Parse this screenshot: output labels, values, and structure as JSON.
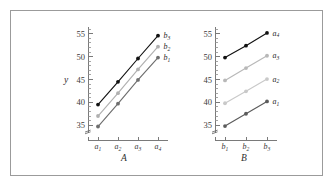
{
  "figure": {
    "background_color": "#ffffff",
    "frame_color": "#9b9b9b"
  },
  "chart_data": [
    {
      "type": "line",
      "panel_id": "A",
      "title": "",
      "xlabel": "A",
      "ylabel": "y",
      "categories": [
        "a1",
        "a2",
        "a3",
        "a4"
      ],
      "category_labels": [
        "a",
        "a",
        "a",
        "a"
      ],
      "category_subscripts": [
        "1",
        "2",
        "3",
        "4"
      ],
      "ylim": [
        33.5,
        56.5
      ],
      "yticks": [
        35,
        40,
        45,
        50,
        55
      ],
      "ytick_labels": [
        "35",
        "40",
        "45",
        "50",
        "55"
      ],
      "yminor_ticks": [
        36,
        37,
        38,
        39,
        41,
        42,
        43,
        44,
        46,
        47,
        48,
        49,
        51,
        52,
        53,
        54,
        56
      ],
      "axis_break": true,
      "grid": false,
      "legend": "inline-right",
      "series": [
        {
          "name": "b3",
          "label_base": "b",
          "label_sub": "3",
          "color": "#121212",
          "marker": "circle",
          "values": [
            39.5,
            44.5,
            49.6,
            54.6
          ]
        },
        {
          "name": "b2",
          "label_base": "b",
          "label_sub": "2",
          "color": "#b0b0b0",
          "marker": "circle",
          "values": [
            37.0,
            42.0,
            47.2,
            52.2
          ]
        },
        {
          "name": "b1",
          "label_base": "b",
          "label_sub": "1",
          "color": "#6e6e6e",
          "marker": "circle",
          "values": [
            34.7,
            39.7,
            44.9,
            49.8
          ]
        }
      ]
    },
    {
      "type": "line",
      "panel_id": "B",
      "title": "",
      "xlabel": "B",
      "ylabel": "",
      "categories": [
        "b1",
        "b2",
        "b3"
      ],
      "category_labels": [
        "b",
        "b",
        "b"
      ],
      "category_subscripts": [
        "1",
        "2",
        "3"
      ],
      "ylim": [
        33.5,
        56.5
      ],
      "yticks": [
        35,
        40,
        45,
        50,
        55
      ],
      "ytick_labels": [
        "35",
        "40",
        "45",
        "50",
        "55"
      ],
      "yminor_ticks": [
        36,
        37,
        38,
        39,
        41,
        42,
        43,
        44,
        46,
        47,
        48,
        49,
        51,
        52,
        53,
        54,
        56
      ],
      "axis_break": true,
      "grid": false,
      "legend": "inline-right",
      "series": [
        {
          "name": "a4",
          "label_base": "a",
          "label_sub": "4",
          "color": "#121212",
          "marker": "circle",
          "values": [
            49.8,
            52.4,
            55.2
          ]
        },
        {
          "name": "a3",
          "label_base": "a",
          "label_sub": "3",
          "color": "#b8b8b8",
          "marker": "circle",
          "values": [
            44.8,
            47.5,
            50.2
          ]
        },
        {
          "name": "a2",
          "label_base": "a",
          "label_sub": "2",
          "color": "#c9c9c9",
          "marker": "circle",
          "values": [
            39.8,
            42.4,
            45.1
          ]
        },
        {
          "name": "a1",
          "label_base": "a",
          "label_sub": "1",
          "color": "#5c5c5c",
          "marker": "circle",
          "values": [
            34.8,
            37.5,
            40.2
          ]
        }
      ]
    }
  ]
}
